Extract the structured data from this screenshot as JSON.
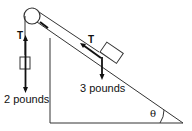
{
  "diagram": {
    "tension_label_left": "T",
    "tension_label_right": "T",
    "hanging_mass_label": "2 pounds",
    "incline_mass_label": "3 pounds",
    "angle_label": "θ",
    "colors": {
      "stroke": "#111111",
      "background": "#ffffff"
    }
  }
}
